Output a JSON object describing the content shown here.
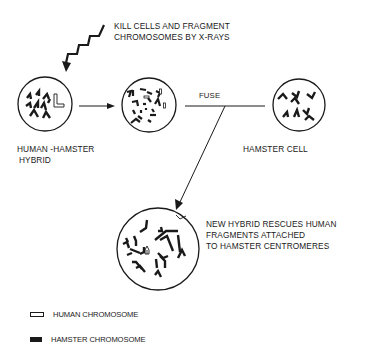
{
  "diagram": {
    "xray_label_line1": "KILL CELLS AND FRAGMENT",
    "xray_label_line2": "CHROMOSOMES BY X-RAYS",
    "fuse_label": "FUSE",
    "cell_hybrid_label_line1": "HUMAN -HAMSTER",
    "cell_hybrid_label_line2": "HYBRID",
    "cell_hamster_label": "HAMSTER CELL",
    "result_label_line1": "NEW HYBRID RESCUES HUMAN",
    "result_label_line2": "FRAGMENTS ATTACHED",
    "result_label_line3": "TO HAMSTER CENTROMERES",
    "icons": {
      "xray": "zigzag-lightning-arrow",
      "arrow": "arrow-right"
    }
  },
  "legend": {
    "items": [
      {
        "label": "HUMAN CHROMOSOME",
        "style": "open"
      },
      {
        "label": "HAMSTER CHROMOSOME",
        "style": "solid"
      }
    ]
  },
  "colors": {
    "ink": "#1a1a1a",
    "background": "#ffffff"
  }
}
